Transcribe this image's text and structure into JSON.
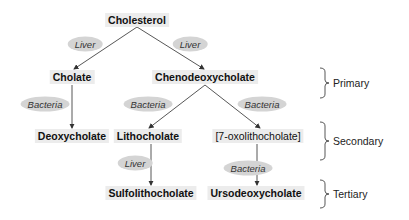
{
  "nodes": {
    "cholesterol": "Cholesterol",
    "cholate": "Cholate",
    "chenodeoxycholate": "Chenodeoxycholate",
    "deoxycholate": "Deoxycholate",
    "lithocholate": "Lithocholate",
    "oxolithocholate": "[7-oxolithocholate]",
    "sulfolithocholate": "Sulfolithocholate",
    "ursodeoxycholate": "Ursodeoxycholate"
  },
  "enzymes": {
    "liver_to_cholate": "Liver",
    "liver_to_cheno": "Liver",
    "bacteria_to_deoxy": "Bacteria",
    "bacteria_to_litho": "Bacteria",
    "bacteria_to_oxo": "Bacteria",
    "liver_to_sulfo": "Liver",
    "bacteria_to_urso": "Bacteria"
  },
  "levels": {
    "primary": "Primary",
    "secondary": "Secondary",
    "tertiary": "Tertiary"
  },
  "colors": {
    "node_bg": "#ececec",
    "enzyme_bg": "#d4d4d4",
    "line": "#444444"
  }
}
